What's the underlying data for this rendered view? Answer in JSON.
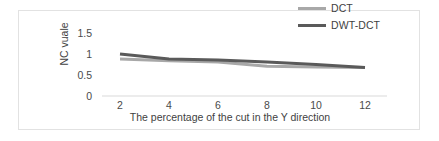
{
  "chart_data": {
    "type": "line",
    "title": "",
    "subtitle": "",
    "xlabel": "The percentage of the cut in the Y direction",
    "ylabel": "NC vuale",
    "x": [
      2,
      4,
      6,
      8,
      10,
      12
    ],
    "categories": [
      "2",
      "4",
      "6",
      "8",
      "10",
      "12"
    ],
    "xtick_labels": [
      "2",
      "4",
      "6",
      "8",
      "10",
      "12"
    ],
    "ytick_labels": [
      "1.5",
      "1",
      "0.5",
      "0"
    ],
    "yticks": [
      1.5,
      1,
      0.5,
      0
    ],
    "xlim": [
      1,
      13
    ],
    "ylim": [
      0,
      1.5
    ],
    "grid": false,
    "legend_position": "top-right",
    "series": [
      {
        "name": "DCT",
        "color": "#a8a8a8",
        "values": [
          0.88,
          0.84,
          0.81,
          0.71,
          0.69,
          0.68
        ]
      },
      {
        "name": "DWT-DCT",
        "color": "#5a5a5a",
        "values": [
          1.0,
          0.88,
          0.86,
          0.81,
          0.75,
          0.68
        ]
      }
    ]
  },
  "legend": {
    "items": [
      {
        "label": "DCT",
        "color": "#a8a8a8"
      },
      {
        "label": "DWT-DCT",
        "color": "#5a5a5a"
      }
    ]
  },
  "axes": {
    "y_title": "NC vuale",
    "x_title": "The percentage of the cut in the Y direction"
  },
  "colors": {
    "frame": "#e2e2e2",
    "baseline": "#d9d9d9",
    "text": "#3f3f3f",
    "series_dct": "#a8a8a8",
    "series_dwt_dct": "#5a5a5a"
  }
}
